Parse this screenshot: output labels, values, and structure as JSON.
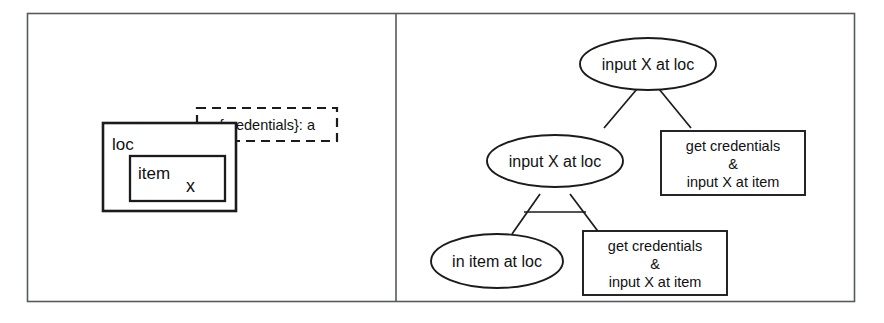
{
  "figure": {
    "panels": [
      {
        "id": "model-panel",
        "name": "system-model-panel"
      },
      {
        "id": "tree-panel",
        "name": "attack-tree-panel"
      }
    ]
  },
  "model": {
    "outer_box_label": "loc",
    "inner_box_label": "item",
    "inner_box_marker": "x",
    "note_label": "{credentials}: a"
  },
  "tree": {
    "root": {
      "label": "input X at loc",
      "shape": "ellipse"
    },
    "level1": {
      "goal": {
        "label": "input X at loc",
        "shape": "ellipse"
      },
      "leaf": {
        "shape": "rect",
        "lines": [
          "get credentials",
          "&",
          "input X at item"
        ]
      }
    },
    "level2": {
      "goal": {
        "label": "in item at loc",
        "shape": "ellipse"
      },
      "leaf": {
        "shape": "rect",
        "lines": [
          "get credentials",
          "&",
          "input X at item"
        ]
      }
    }
  },
  "colors": {
    "frame": "#555a5e",
    "ink": "#1b1b1b",
    "background": "#ffffff"
  }
}
